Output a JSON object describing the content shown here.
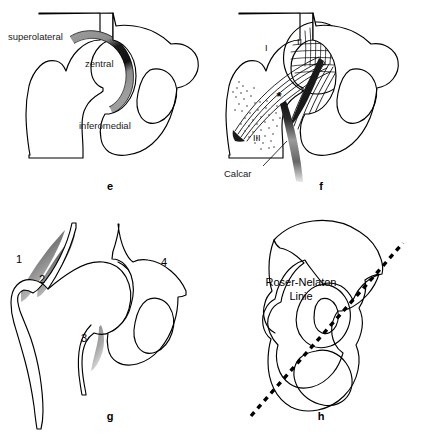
{
  "figure": {
    "background_color": "#ffffff",
    "line_color": "#000000",
    "shade_color": "#8a8a8a"
  },
  "panels": [
    {
      "id": "e",
      "letter": "e",
      "description": "Acetabular cartilage load zones of the hip joint",
      "labels": [
        {
          "name": "superolateral",
          "text": "superolateral"
        },
        {
          "name": "zentral",
          "text": "zentral"
        },
        {
          "name": "inferomedial",
          "text": "inferomedial"
        }
      ]
    },
    {
      "id": "f",
      "letter": "f",
      "description": "Trabecular bone systems of the proximal femur",
      "labels": [
        {
          "name": "group-i",
          "text": "I"
        },
        {
          "name": "group-ii",
          "text": "II"
        },
        {
          "name": "group-iii",
          "text": "III"
        },
        {
          "name": "wards-triangle",
          "text": "*"
        },
        {
          "name": "calcar",
          "text": "Calcar"
        }
      ]
    },
    {
      "id": "g",
      "letter": "g",
      "description": "Numbered shaded regions around the hip joint",
      "labels": [
        {
          "name": "region-1",
          "text": "1"
        },
        {
          "name": "region-2",
          "text": "2"
        },
        {
          "name": "region-3",
          "text": "3"
        },
        {
          "name": "region-4",
          "text": "4"
        }
      ]
    },
    {
      "id": "h",
      "letter": "h",
      "description": "Pelvis with Roser-Nelaton line",
      "labels": [
        {
          "name": "roser-nelaton-line-1",
          "text": "Roser-Nelaton"
        },
        {
          "name": "roser-nelaton-line-2",
          "text": "Linie"
        }
      ]
    }
  ]
}
